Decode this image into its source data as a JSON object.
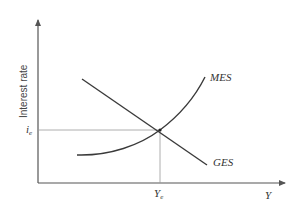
{
  "diagram": {
    "y_axis_label": "Interest rate",
    "x_axis_label": "Y",
    "equilibrium_rate_label": "i",
    "equilibrium_rate_sub": "e",
    "equilibrium_output_label": "Y",
    "equilibrium_output_sub": "e",
    "curves": [
      {
        "name": "MES",
        "label": "MES",
        "shape": "upward-sloping convex"
      },
      {
        "name": "GES",
        "label": "GES",
        "shape": "downward-sloping linear"
      }
    ],
    "colors": {
      "line": "#3a3a3a",
      "guide": "#9a9a9a",
      "background": "#ffffff"
    }
  }
}
